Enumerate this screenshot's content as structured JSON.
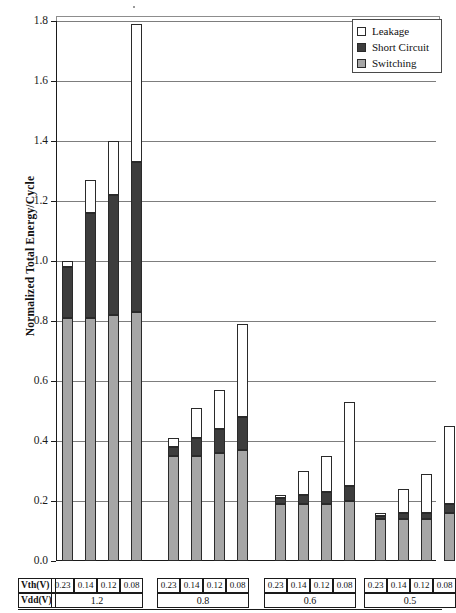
{
  "chart_data": {
    "type": "bar",
    "stacked": true,
    "title": "",
    "xlabel": "",
    "ylabel": "Normalized Total Energy/Cycle",
    "ylim": [
      0.0,
      1.8
    ],
    "ytick_step": 0.2,
    "ytick_labels": [
      "1.8",
      "1.6",
      "1.4",
      "1.2",
      "1.0",
      "0.8",
      "0.6",
      "0.4",
      "0.2",
      "0.0"
    ],
    "ytick_values": [
      1.8,
      1.6,
      1.4,
      1.2,
      1.0,
      0.8,
      0.6,
      0.4,
      0.2,
      0.0
    ],
    "grid": true,
    "legend_position": "top-right",
    "series": [
      {
        "name": "Leakage",
        "color": "#ffffff",
        "values": [
          0.02,
          0.11,
          0.18,
          0.46,
          0.03,
          0.1,
          0.13,
          0.31,
          0.01,
          0.08,
          0.12,
          0.28,
          0.01,
          0.08,
          0.13,
          0.26
        ]
      },
      {
        "name": "Short Circuit",
        "color": "#3d3d3d",
        "values": [
          0.17,
          0.35,
          0.4,
          0.5,
          0.03,
          0.06,
          0.08,
          0.11,
          0.02,
          0.03,
          0.04,
          0.05,
          0.01,
          0.02,
          0.02,
          0.03
        ]
      },
      {
        "name": "Switching",
        "color": "#a6a6a6",
        "values": [
          0.81,
          0.81,
          0.82,
          0.83,
          0.35,
          0.35,
          0.36,
          0.37,
          0.19,
          0.19,
          0.19,
          0.2,
          0.14,
          0.14,
          0.14,
          0.16
        ]
      }
    ],
    "cumulative_totals": [
      1.0,
      1.27,
      1.4,
      1.79,
      0.41,
      0.51,
      0.57,
      0.79,
      0.22,
      0.3,
      0.35,
      0.53,
      0.16,
      0.24,
      0.29,
      0.45
    ],
    "categories": [
      "Vth 0.23 / Vdd 1.2",
      "Vth 0.14 / Vdd 1.2",
      "Vth 0.12 / Vdd 1.2",
      "Vth 0.08 / Vdd 1.2",
      "Vth 0.23 / Vdd 0.8",
      "Vth 0.14 / Vdd 0.8",
      "Vth 0.12 / Vdd 0.8",
      "Vth 0.08 / Vdd 0.8",
      "Vth 0.23 / Vdd 0.6",
      "Vth 0.14 / Vdd 0.6",
      "Vth 0.12 / Vdd 0.6",
      "Vth 0.08 / Vdd 0.6",
      "Vth 0.23 / Vdd 0.5",
      "Vth 0.14 / Vdd 0.5",
      "Vth 0.12 / Vdd 0.5",
      "Vth 0.08 / Vdd 0.5"
    ]
  },
  "axis": {
    "y_title": "Normalized Total Energy/Cycle",
    "y_labels": [
      "1.8",
      "1.6",
      "1.4",
      "1.2",
      "1.0",
      "0.8",
      "0.6",
      "0.4",
      "0.2",
      "0.0"
    ]
  },
  "legend": {
    "items": [
      {
        "label": "Leakage",
        "color": "#ffffff"
      },
      {
        "label": "Short Circuit",
        "color": "#3d3d3d"
      },
      {
        "label": "Switching",
        "color": "#a6a6a6"
      }
    ]
  },
  "table": {
    "row_headers": [
      "Vth(V)",
      "Vdd(V)"
    ],
    "groups": [
      {
        "vdd": "1.2",
        "vth": [
          "0.23",
          "0.14",
          "0.12",
          "0.08"
        ]
      },
      {
        "vdd": "0.8",
        "vth": [
          "0.23",
          "0.14",
          "0.12",
          "0.08"
        ]
      },
      {
        "vdd": "0.6",
        "vth": [
          "0.23",
          "0.14",
          "0.12",
          "0.08"
        ]
      },
      {
        "vdd": "0.5",
        "vth": [
          "0.23",
          "0.14",
          "0.12",
          "0.08"
        ]
      }
    ]
  }
}
